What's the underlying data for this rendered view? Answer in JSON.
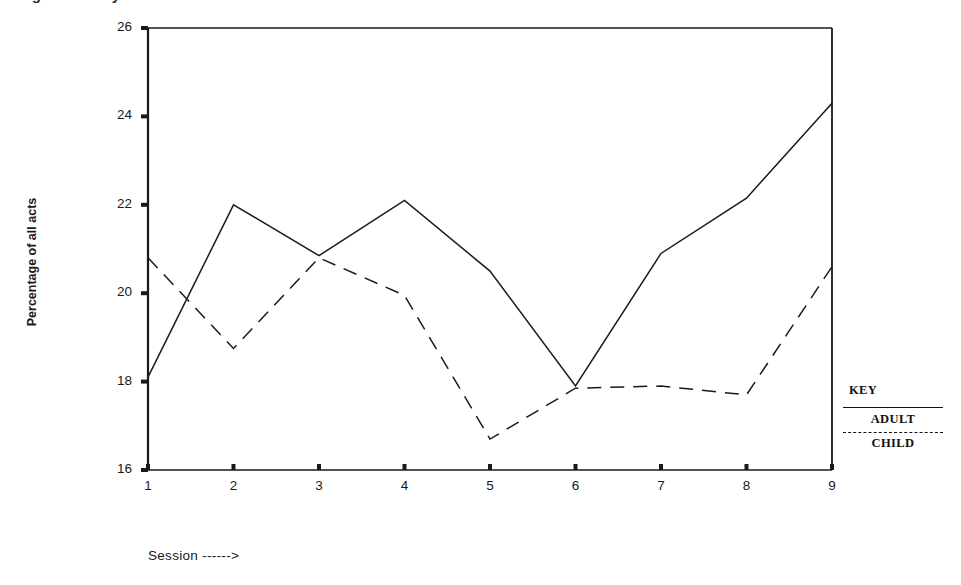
{
  "figure": {
    "clipped_title": "Fig.    ...    acts   by",
    "background_color": "#ffffff",
    "line_color": "#1a1a1a"
  },
  "axes": {
    "ylabel": "Percentage of all acts",
    "xlabel": "Session ------>",
    "yticks": [
      "16",
      "18",
      "20",
      "22",
      "24",
      "26"
    ],
    "xticks": [
      "1",
      "2",
      "3",
      "4",
      "5",
      "6",
      "7",
      "8",
      "9"
    ]
  },
  "legend": {
    "title": "KEY",
    "entries": [
      {
        "label": "ADULT",
        "style": "solid"
      },
      {
        "label": "CHILD",
        "style": "dashed"
      }
    ]
  },
  "chart_data": {
    "type": "line",
    "title": "",
    "xlabel": "Session ------>",
    "ylabel": "Percentage of all acts",
    "x": [
      1,
      2,
      3,
      4,
      5,
      6,
      7,
      8,
      9
    ],
    "xlim": [
      1,
      9
    ],
    "ylim": [
      16,
      26
    ],
    "ytick_values": [
      16,
      18,
      20,
      22,
      24,
      26
    ],
    "grid": false,
    "legend_position": "right",
    "series": [
      {
        "name": "ADULT",
        "style": "solid",
        "color": "#1a1a1a",
        "values": [
          18.1,
          22.0,
          20.85,
          22.1,
          20.5,
          17.9,
          20.9,
          22.15,
          24.3
        ]
      },
      {
        "name": "CHILD",
        "style": "dashed",
        "color": "#1a1a1a",
        "values": [
          20.8,
          18.75,
          20.8,
          19.95,
          16.7,
          17.85,
          17.9,
          17.7,
          20.6
        ]
      }
    ]
  }
}
